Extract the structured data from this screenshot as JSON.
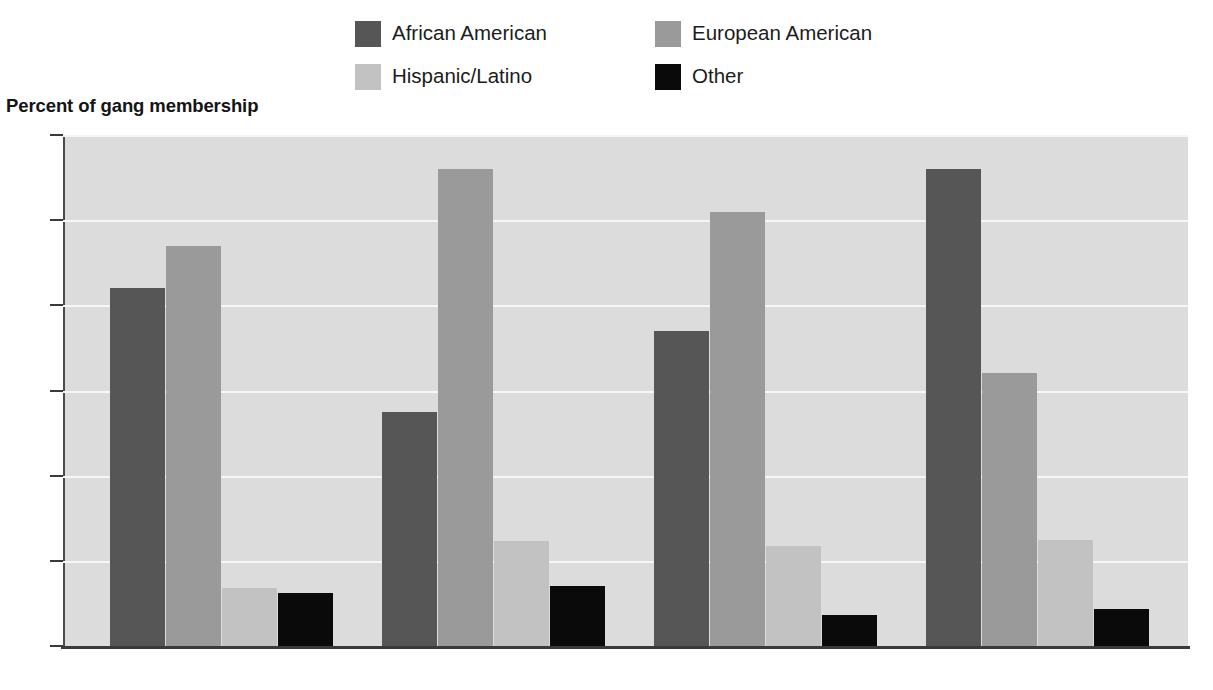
{
  "axis_title": "Percent of gang membership",
  "legend": {
    "items": [
      {
        "label": "African American",
        "color": "#565656",
        "swatch_name": "legend-swatch-african-american"
      },
      {
        "label": "European American",
        "color": "#9a9a9a",
        "swatch_name": "legend-swatch-european-american"
      },
      {
        "label": "Hispanic/Latino",
        "color": "#c2c2c2",
        "swatch_name": "legend-swatch-hispanic-latino"
      },
      {
        "label": "Other",
        "color": "#0a0a0a",
        "swatch_name": "legend-swatch-other"
      }
    ]
  },
  "chart_data": {
    "type": "bar",
    "title": "",
    "ylabel": "Percent of gang membership",
    "xlabel": "",
    "ylim": [
      0,
      60
    ],
    "yticks": [
      0,
      10,
      20,
      30,
      40,
      50,
      60
    ],
    "grid": true,
    "legend_position": "top",
    "categories": [
      "Larger cities",
      "Suburban counties",
      "Smaller cities",
      "Rural counties"
    ],
    "series": [
      {
        "name": "African American",
        "color": "#565656",
        "values": [
          42,
          27.5,
          37,
          56
        ]
      },
      {
        "name": "European American",
        "color": "#9a9a9a",
        "values": [
          47,
          56,
          51,
          32
        ]
      },
      {
        "name": "Hispanic/Latino",
        "color": "#c2c2c2",
        "values": [
          6.8,
          12.3,
          11.8,
          12.5
        ]
      },
      {
        "name": "Other",
        "color": "#0a0a0a",
        "values": [
          6.2,
          7,
          3.7,
          4.4
        ]
      }
    ]
  },
  "colors": {
    "plot_background": "#dcdcdc",
    "gridline": "#f6f6f6",
    "axis": "#3a3a3a",
    "page_background": "#ffffff"
  }
}
